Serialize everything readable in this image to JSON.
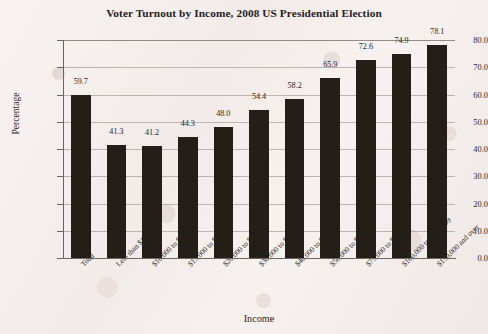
{
  "chart_data": {
    "type": "bar",
    "title": "Voter Turnout by Income, 2008 US Presidential Election",
    "xlabel": "Income",
    "ylabel": "Percentage",
    "ylim": [
      0,
      80
    ],
    "ytick_step": 10,
    "ytick_labels": [
      "0.0",
      "10.0",
      "20.0",
      "30.0",
      "40.0",
      "50.0",
      "60.0",
      "70.0",
      "80.0"
    ],
    "grid": true,
    "legend": false,
    "bar_color": "#241e18",
    "categories": [
      "Total",
      "Less than $10,000",
      "$10,000 to $14,999",
      "$15,000 to $19,999",
      "$20,000 to $29,999",
      "$30,000 to $39,999",
      "$40,000 to $49,999",
      "$50,000 to $74,999",
      "$75,000 to $99,999",
      "$100,000 to $149,999",
      "$150,000 and over"
    ],
    "values": [
      59.7,
      41.3,
      41.2,
      44.3,
      48.0,
      54.4,
      58.2,
      65.9,
      72.6,
      74.9,
      78.1
    ],
    "value_labels": [
      "59.7",
      "41.3",
      "41.2",
      "44.3",
      "48.0",
      "54.4",
      "58.2",
      "65.9",
      "72.6",
      "74.9",
      "78.1"
    ]
  }
}
